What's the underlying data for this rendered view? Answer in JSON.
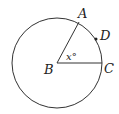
{
  "diagram": {
    "type": "circle-geometry",
    "center": {
      "label": "B",
      "x": 57,
      "y": 63
    },
    "radius": 45,
    "points": [
      {
        "label": "A",
        "x": 79,
        "y": 23
      },
      {
        "label": "C",
        "x": 102,
        "y": 63
      },
      {
        "label": "D",
        "x": 96,
        "y": 40
      }
    ],
    "angle_label": "x°",
    "segments": [
      "BA",
      "BC"
    ],
    "stroke_color": "#333333"
  }
}
